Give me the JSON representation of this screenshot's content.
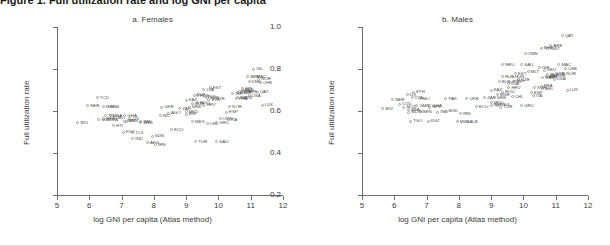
{
  "figure": {
    "title": "Figure 1. Full utilization rate and log GNI per capita",
    "x_axis_label": "log GNI per capita (Atlas method)",
    "y_axis_label": "Full utilization rate",
    "y_ticks": [
      "0.2",
      "0.4",
      "0.6",
      "0.8",
      "1.0"
    ],
    "x_ticks": [
      "5",
      "6",
      "7",
      "8",
      "9",
      "10",
      "11",
      "12"
    ]
  },
  "panels": [
    {
      "id": "a",
      "title": "a. Females"
    },
    {
      "id": "b",
      "title": "b. Males"
    }
  ],
  "chart_data": {
    "type": "scatter",
    "title": "Full utilization rate and log GNI per capita",
    "xlabel": "log GNI per capita (Atlas method)",
    "ylabel": "Full utilization rate",
    "xlim": [
      5,
      12
    ],
    "ylim": [
      0.2,
      1.0
    ],
    "xticks": [
      5,
      6,
      7,
      8,
      9,
      10,
      11,
      12
    ],
    "yticks": [
      0.2,
      0.4,
      0.6,
      0.8,
      1.0
    ],
    "grid": false,
    "legend": "none",
    "marker": "open-circle",
    "panels": [
      {
        "id": "a",
        "title": "a. Females",
        "points": [
          {
            "label": "TCD",
            "x": 6.25,
            "y": 0.665
          },
          {
            "label": "NER",
            "x": 5.95,
            "y": 0.625
          },
          {
            "label": "GIN",
            "x": 6.45,
            "y": 0.622
          },
          {
            "label": "GNB",
            "x": 6.55,
            "y": 0.62
          },
          {
            "label": "BDI",
            "x": 5.65,
            "y": 0.545
          },
          {
            "label": "MOZ",
            "x": 6.3,
            "y": 0.56
          },
          {
            "label": "TZA",
            "x": 6.55,
            "y": 0.56
          },
          {
            "label": "TGO",
            "x": 6.5,
            "y": 0.578
          },
          {
            "label": "UGA",
            "x": 6.65,
            "y": 0.578
          },
          {
            "label": "MLI",
            "x": 6.8,
            "y": 0.568
          },
          {
            "label": "BFA",
            "x": 6.45,
            "y": 0.565
          },
          {
            "label": "GHA",
            "x": 7.1,
            "y": 0.578
          },
          {
            "label": "CIV",
            "x": 7.25,
            "y": 0.565
          },
          {
            "label": "KEN",
            "x": 7.15,
            "y": 0.552
          },
          {
            "label": "HTI",
            "x": 6.75,
            "y": 0.53
          },
          {
            "label": "KGZ",
            "x": 7.05,
            "y": 0.5
          },
          {
            "label": "TLS",
            "x": 7.35,
            "y": 0.498
          },
          {
            "label": "IND",
            "x": 7.35,
            "y": 0.47
          },
          {
            "label": "ECU",
            "x": 8.55,
            "y": 0.51
          },
          {
            "label": "SDN",
            "x": 7.95,
            "y": 0.48
          },
          {
            "label": "AFG",
            "x": 7.8,
            "y": 0.448
          },
          {
            "label": "IRN",
            "x": 8.05,
            "y": 0.44
          },
          {
            "label": "UKR",
            "x": 8.25,
            "y": 0.618
          },
          {
            "label": "AGO",
            "x": 8.45,
            "y": 0.59
          },
          {
            "label": "ZAF",
            "x": 8.8,
            "y": 0.61
          },
          {
            "label": "NIC",
            "x": 8.2,
            "y": 0.578
          },
          {
            "label": "PAK",
            "x": 7.6,
            "y": 0.548
          },
          {
            "label": "BGD",
            "x": 7.6,
            "y": 0.545
          },
          {
            "label": "NPL",
            "x": 7.1,
            "y": 0.552
          },
          {
            "label": "KAZ",
            "x": 9.0,
            "y": 0.652
          },
          {
            "label": "EST",
            "x": 9.75,
            "y": 0.712
          },
          {
            "label": "LVA",
            "x": 9.55,
            "y": 0.702
          },
          {
            "label": "BLR",
            "x": 9.25,
            "y": 0.675
          },
          {
            "label": "RUS",
            "x": 9.35,
            "y": 0.672
          },
          {
            "label": "POL",
            "x": 9.6,
            "y": 0.668
          },
          {
            "label": "HUN",
            "x": 9.65,
            "y": 0.662
          },
          {
            "label": "CZE",
            "x": 9.85,
            "y": 0.66
          },
          {
            "label": "SVK",
            "x": 9.7,
            "y": 0.655
          },
          {
            "label": "ROU",
            "x": 9.35,
            "y": 0.64
          },
          {
            "label": "BGR",
            "x": 9.2,
            "y": 0.635
          },
          {
            "label": "HRV",
            "x": 9.55,
            "y": 0.628
          },
          {
            "label": "SRB",
            "x": 9.1,
            "y": 0.618
          },
          {
            "label": "MKD",
            "x": 9.0,
            "y": 0.598
          },
          {
            "label": "BIH",
            "x": 9.0,
            "y": 0.585
          },
          {
            "label": "TUR",
            "x": 9.3,
            "y": 0.455
          },
          {
            "label": "SAU",
            "x": 9.95,
            "y": 0.455
          },
          {
            "label": "OMN",
            "x": 10.05,
            "y": 0.562
          },
          {
            "label": "MEX",
            "x": 9.2,
            "y": 0.548
          },
          {
            "label": "CHL",
            "x": 9.65,
            "y": 0.54
          },
          {
            "label": "GRC",
            "x": 9.95,
            "y": 0.545
          },
          {
            "label": "ITA",
            "x": 10.3,
            "y": 0.56
          },
          {
            "label": "ESP",
            "x": 10.25,
            "y": 0.595
          },
          {
            "label": "FRA",
            "x": 10.55,
            "y": 0.66
          },
          {
            "label": "DEU",
            "x": 10.65,
            "y": 0.695
          },
          {
            "label": "GBR",
            "x": 10.6,
            "y": 0.69
          },
          {
            "label": "NLD",
            "x": 10.75,
            "y": 0.7
          },
          {
            "label": "AUT",
            "x": 10.7,
            "y": 0.688
          },
          {
            "label": "BEL",
            "x": 10.6,
            "y": 0.665
          },
          {
            "label": "FIN",
            "x": 10.75,
            "y": 0.705
          },
          {
            "label": "DNK",
            "x": 10.95,
            "y": 0.74
          },
          {
            "label": "SWE",
            "x": 10.9,
            "y": 0.765
          },
          {
            "label": "MAC",
            "x": 11.1,
            "y": 0.762
          },
          {
            "label": "NOR",
            "x": 11.25,
            "y": 0.752
          },
          {
            "label": "CHE",
            "x": 11.3,
            "y": 0.735
          },
          {
            "label": "ISL",
            "x": 11.1,
            "y": 0.8
          },
          {
            "label": "LUX",
            "x": 11.35,
            "y": 0.628
          },
          {
            "label": "USA",
            "x": 10.95,
            "y": 0.672
          },
          {
            "label": "JPN",
            "x": 10.7,
            "y": 0.665
          },
          {
            "label": "KOR",
            "x": 10.35,
            "y": 0.622
          },
          {
            "label": "ISR",
            "x": 10.45,
            "y": 0.682
          },
          {
            "label": "ARE",
            "x": 10.85,
            "y": 0.69
          },
          {
            "label": "QAT",
            "x": 11.2,
            "y": 0.69
          }
        ]
      },
      {
        "id": "b",
        "title": "b. Males",
        "points": [
          {
            "label": "QAT",
            "x": 11.2,
            "y": 0.958
          },
          {
            "label": "ARE",
            "x": 10.85,
            "y": 0.912
          },
          {
            "label": "KWT",
            "x": 10.75,
            "y": 0.898
          },
          {
            "label": "BHR",
            "x": 10.55,
            "y": 0.9
          },
          {
            "label": "OMN",
            "x": 10.05,
            "y": 0.872
          },
          {
            "label": "SAU",
            "x": 9.95,
            "y": 0.822
          },
          {
            "label": "NRU",
            "x": 9.35,
            "y": 0.822
          },
          {
            "label": "MAC",
            "x": 11.1,
            "y": 0.822
          },
          {
            "label": "ISR",
            "x": 10.5,
            "y": 0.805
          },
          {
            "label": "CHE",
            "x": 11.3,
            "y": 0.802
          },
          {
            "label": "DEU",
            "x": 10.65,
            "y": 0.795
          },
          {
            "label": "NOR",
            "x": 11.25,
            "y": 0.778
          },
          {
            "label": "SWE",
            "x": 10.9,
            "y": 0.775
          },
          {
            "label": "DNK",
            "x": 10.95,
            "y": 0.768
          },
          {
            "label": "NLD",
            "x": 10.75,
            "y": 0.772
          },
          {
            "label": "AUT",
            "x": 10.7,
            "y": 0.765
          },
          {
            "label": "JPN",
            "x": 10.7,
            "y": 0.762
          },
          {
            "label": "GBR",
            "x": 10.6,
            "y": 0.758
          },
          {
            "label": "USA",
            "x": 10.95,
            "y": 0.752
          },
          {
            "label": "MLT",
            "x": 10.15,
            "y": 0.788
          },
          {
            "label": "EST",
            "x": 9.75,
            "y": 0.778
          },
          {
            "label": "RUS",
            "x": 9.35,
            "y": 0.762
          },
          {
            "label": "HUN",
            "x": 9.65,
            "y": 0.762
          },
          {
            "label": "BLR",
            "x": 9.25,
            "y": 0.74
          },
          {
            "label": "CZE",
            "x": 9.85,
            "y": 0.748
          },
          {
            "label": "SVK",
            "x": 9.7,
            "y": 0.742
          },
          {
            "label": "POL",
            "x": 9.6,
            "y": 0.738
          },
          {
            "label": "LVA",
            "x": 9.55,
            "y": 0.73
          },
          {
            "label": "HRV",
            "x": 9.55,
            "y": 0.712
          },
          {
            "label": "FRA",
            "x": 10.55,
            "y": 0.718
          },
          {
            "label": "BEL",
            "x": 10.6,
            "y": 0.705
          },
          {
            "label": "KOR",
            "x": 10.35,
            "y": 0.712
          },
          {
            "label": "LUX",
            "x": 11.35,
            "y": 0.7
          },
          {
            "label": "ESP",
            "x": 10.25,
            "y": 0.688
          },
          {
            "label": "ITA",
            "x": 10.3,
            "y": 0.672
          },
          {
            "label": "GRC",
            "x": 9.95,
            "y": 0.625
          },
          {
            "label": "ETH",
            "x": 6.6,
            "y": 0.69
          },
          {
            "label": "DJI",
            "x": 6.4,
            "y": 0.678
          },
          {
            "label": "NER",
            "x": 5.95,
            "y": 0.655
          },
          {
            "label": "TZA",
            "x": 6.55,
            "y": 0.662
          },
          {
            "label": "MLI",
            "x": 6.8,
            "y": 0.66
          },
          {
            "label": "PAK",
            "x": 7.6,
            "y": 0.66
          },
          {
            "label": "COD",
            "x": 6.15,
            "y": 0.632
          },
          {
            "label": "MOZ",
            "x": 6.3,
            "y": 0.618
          },
          {
            "label": "BDI",
            "x": 5.65,
            "y": 0.612
          },
          {
            "label": "GMB",
            "x": 6.7,
            "y": 0.625
          },
          {
            "label": "BFA",
            "x": 6.45,
            "y": 0.608
          },
          {
            "label": "BEN",
            "x": 6.8,
            "y": 0.598
          },
          {
            "label": "GHA",
            "x": 7.1,
            "y": 0.625
          },
          {
            "label": "NPL",
            "x": 7.1,
            "y": 0.618
          },
          {
            "label": "MDG",
            "x": 6.45,
            "y": 0.595
          },
          {
            "label": "TGO",
            "x": 6.5,
            "y": 0.552
          },
          {
            "label": "KGZ",
            "x": 7.05,
            "y": 0.552
          },
          {
            "label": "MDA",
            "x": 7.95,
            "y": 0.548
          },
          {
            "label": "ALB",
            "x": 8.25,
            "y": 0.548
          },
          {
            "label": "IND",
            "x": 7.35,
            "y": 0.595
          },
          {
            "label": "BGD",
            "x": 7.6,
            "y": 0.6
          },
          {
            "label": "UKR",
            "x": 8.25,
            "y": 0.66
          },
          {
            "label": "ZAF",
            "x": 8.8,
            "y": 0.662
          },
          {
            "label": "MEX",
            "x": 9.2,
            "y": 0.628
          },
          {
            "label": "ECU",
            "x": 8.55,
            "y": 0.62
          },
          {
            "label": "TUR",
            "x": 9.3,
            "y": 0.618
          },
          {
            "label": "IRN",
            "x": 8.05,
            "y": 0.588
          },
          {
            "label": "CHL",
            "x": 9.65,
            "y": 0.668
          },
          {
            "label": "ROU",
            "x": 9.35,
            "y": 0.69
          },
          {
            "label": "BGR",
            "x": 9.2,
            "y": 0.678
          },
          {
            "label": "SRB",
            "x": 9.1,
            "y": 0.662
          },
          {
            "label": "MKD",
            "x": 9.0,
            "y": 0.64
          },
          {
            "label": "KAZ",
            "x": 9.0,
            "y": 0.7
          },
          {
            "label": "BIH",
            "x": 9.0,
            "y": 0.628
          }
        ]
      }
    ]
  }
}
